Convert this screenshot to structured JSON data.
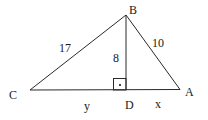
{
  "diagram": {
    "type": "geometry-triangle",
    "colors": {
      "stroke": "#2a2a2a",
      "text": "#1a1a1a",
      "background": "#ffffff"
    },
    "vertices": {
      "B": {
        "label": "B",
        "x": 126,
        "y": 15
      },
      "C": {
        "label": "C",
        "x": 30,
        "y": 90
      },
      "A": {
        "label": "A",
        "x": 180,
        "y": 89.5
      },
      "D": {
        "label": "D",
        "x": 126,
        "y": 90
      }
    },
    "segments": {
      "CB": {
        "label": "17"
      },
      "BA": {
        "label": "10"
      },
      "BD": {
        "label": "8"
      },
      "CD": {
        "label": "y"
      },
      "DA": {
        "label": "x"
      }
    },
    "right_angle_marker": {
      "at": "D",
      "size": 12,
      "dot": true
    }
  }
}
